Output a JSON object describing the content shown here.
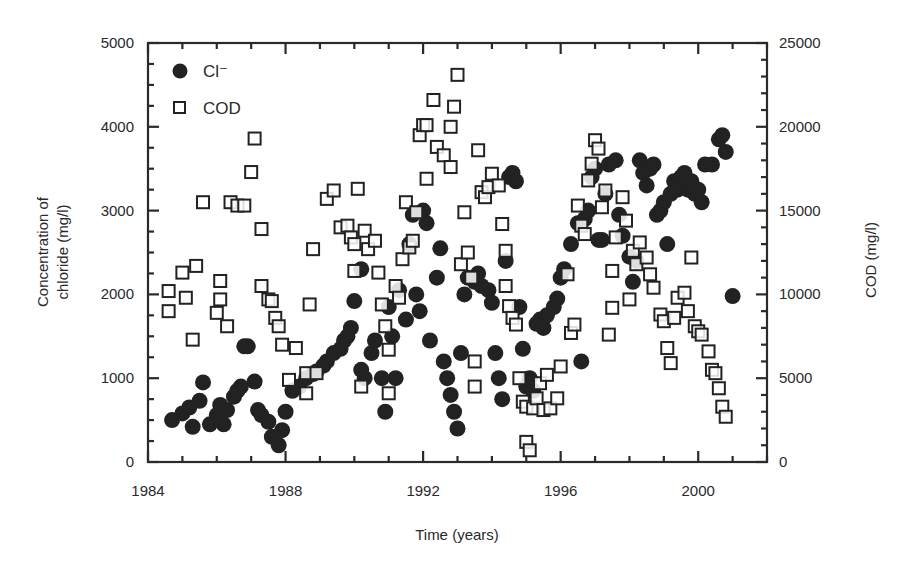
{
  "chart_data": {
    "type": "scatter",
    "title": "",
    "xlabel": "Time (years)",
    "ylabel": "Concentration of chloride (mg/l)",
    "ylabel_lines": [
      "Concentration of",
      "chloride (mg/l)"
    ],
    "y2label": "COD (mg/l)",
    "xlim": [
      1984,
      2002
    ],
    "ylim": [
      0,
      5000
    ],
    "y2lim": [
      0,
      25000
    ],
    "x_ticks": [
      1984,
      1988,
      1992,
      1996,
      2000
    ],
    "x_tick_labels": [
      "1984",
      "1988",
      "1992",
      "1996",
      "2000"
    ],
    "y_ticks": [
      0,
      1000,
      2000,
      3000,
      4000,
      5000
    ],
    "y_tick_labels": [
      "0",
      "1000",
      "2000",
      "3000",
      "4000",
      "5000"
    ],
    "y2_ticks": [
      0,
      5000,
      10000,
      15000,
      20000,
      25000
    ],
    "y2_tick_labels": [
      "0",
      "5000",
      "10000",
      "15000",
      "20000",
      "25000"
    ],
    "grid": false,
    "legend_position": "upper-left-inside",
    "legend": [
      {
        "label": "Cl⁻",
        "marker": "filled-circle",
        "axis": "left"
      },
      {
        "label": "COD",
        "marker": "open-square",
        "axis": "right"
      }
    ],
    "series": [
      {
        "name": "Cl⁻",
        "marker": "filled-circle",
        "axis": "left",
        "points": [
          [
            1984.7,
            500
          ],
          [
            1985.0,
            580
          ],
          [
            1985.2,
            650
          ],
          [
            1985.3,
            420
          ],
          [
            1985.5,
            730
          ],
          [
            1985.6,
            950
          ],
          [
            1985.8,
            450
          ],
          [
            1986.0,
            560
          ],
          [
            1986.1,
            680
          ],
          [
            1986.2,
            450
          ],
          [
            1986.3,
            620
          ],
          [
            1986.5,
            780
          ],
          [
            1986.6,
            850
          ],
          [
            1986.7,
            900
          ],
          [
            1986.8,
            1380
          ],
          [
            1986.9,
            1380
          ],
          [
            1987.1,
            960
          ],
          [
            1987.2,
            620
          ],
          [
            1987.3,
            560
          ],
          [
            1987.5,
            480
          ],
          [
            1987.6,
            300
          ],
          [
            1987.8,
            200
          ],
          [
            1987.9,
            380
          ],
          [
            1988.0,
            600
          ],
          [
            1988.2,
            850
          ],
          [
            1988.4,
            900
          ],
          [
            1988.6,
            1000
          ],
          [
            1988.8,
            1050
          ],
          [
            1988.9,
            1080
          ],
          [
            1989.1,
            1150
          ],
          [
            1989.2,
            1200
          ],
          [
            1989.4,
            1300
          ],
          [
            1989.6,
            1350
          ],
          [
            1989.7,
            1450
          ],
          [
            1989.8,
            1500
          ],
          [
            1989.9,
            1600
          ],
          [
            1990.0,
            1920
          ],
          [
            1990.2,
            2300
          ],
          [
            1990.2,
            1100
          ],
          [
            1990.3,
            1000
          ],
          [
            1990.5,
            1300
          ],
          [
            1990.6,
            1450
          ],
          [
            1990.8,
            1000
          ],
          [
            1990.9,
            600
          ],
          [
            1991.0,
            1850
          ],
          [
            1991.1,
            1500
          ],
          [
            1991.2,
            1000
          ],
          [
            1991.3,
            2050
          ],
          [
            1991.5,
            1700
          ],
          [
            1991.6,
            2600
          ],
          [
            1991.7,
            2950
          ],
          [
            1991.8,
            2000
          ],
          [
            1991.9,
            1800
          ],
          [
            1992.0,
            3000
          ],
          [
            1992.1,
            2850
          ],
          [
            1992.2,
            1450
          ],
          [
            1992.4,
            2200
          ],
          [
            1992.5,
            2550
          ],
          [
            1992.6,
            1200
          ],
          [
            1992.7,
            1000
          ],
          [
            1992.8,
            800
          ],
          [
            1992.9,
            600
          ],
          [
            1993.0,
            400
          ],
          [
            1993.1,
            1300
          ],
          [
            1993.2,
            2000
          ],
          [
            1993.3,
            2200
          ],
          [
            1993.5,
            2150
          ],
          [
            1993.6,
            2250
          ],
          [
            1993.7,
            2100
          ],
          [
            1993.9,
            2050
          ],
          [
            1994.0,
            1900
          ],
          [
            1994.1,
            1300
          ],
          [
            1994.2,
            1000
          ],
          [
            1994.3,
            750
          ],
          [
            1994.4,
            2400
          ],
          [
            1994.5,
            3400
          ],
          [
            1994.6,
            3450
          ],
          [
            1994.7,
            3350
          ],
          [
            1994.8,
            1850
          ],
          [
            1994.9,
            1350
          ],
          [
            1995.0,
            900
          ],
          [
            1995.1,
            1000
          ],
          [
            1995.2,
            850
          ],
          [
            1995.3,
            1650
          ],
          [
            1995.4,
            1700
          ],
          [
            1995.5,
            1600
          ],
          [
            1995.6,
            1750
          ],
          [
            1995.8,
            1850
          ],
          [
            1995.9,
            1950
          ],
          [
            1996.0,
            2200
          ],
          [
            1996.1,
            2300
          ],
          [
            1996.3,
            2600
          ],
          [
            1996.5,
            2850
          ],
          [
            1996.6,
            1200
          ],
          [
            1996.7,
            2900
          ],
          [
            1996.8,
            3000
          ],
          [
            1996.9,
            3400
          ],
          [
            1997.0,
            3500
          ],
          [
            1997.1,
            2650
          ],
          [
            1997.2,
            2650
          ],
          [
            1997.3,
            3200
          ],
          [
            1997.4,
            3550
          ],
          [
            1997.6,
            3600
          ],
          [
            1997.7,
            2950
          ],
          [
            1997.8,
            2700
          ],
          [
            1998.0,
            2450
          ],
          [
            1998.1,
            2150
          ],
          [
            1998.2,
            2400
          ],
          [
            1998.3,
            3600
          ],
          [
            1998.4,
            3450
          ],
          [
            1998.5,
            3300
          ],
          [
            1998.6,
            3500
          ],
          [
            1998.7,
            3550
          ],
          [
            1998.8,
            2950
          ],
          [
            1998.9,
            3000
          ],
          [
            1999.0,
            3100
          ],
          [
            1999.1,
            2600
          ],
          [
            1999.2,
            3200
          ],
          [
            1999.3,
            3350
          ],
          [
            1999.4,
            3250
          ],
          [
            1999.5,
            3400
          ],
          [
            1999.6,
            3450
          ],
          [
            1999.7,
            3250
          ],
          [
            1999.8,
            3350
          ],
          [
            1999.9,
            3200
          ],
          [
            2000.0,
            3250
          ],
          [
            2000.1,
            3100
          ],
          [
            2000.2,
            3550
          ],
          [
            2000.4,
            3550
          ],
          [
            2000.6,
            3850
          ],
          [
            2000.7,
            3900
          ],
          [
            2000.8,
            3700
          ],
          [
            2001.0,
            1980
          ]
        ]
      },
      {
        "name": "COD",
        "marker": "open-square",
        "axis": "right",
        "points": [
          [
            1984.6,
            9000
          ],
          [
            1984.6,
            10200
          ],
          [
            1985.0,
            11300
          ],
          [
            1985.1,
            9800
          ],
          [
            1985.4,
            11700
          ],
          [
            1985.3,
            7300
          ],
          [
            1985.6,
            15500
          ],
          [
            1986.0,
            8900
          ],
          [
            1986.1,
            10800
          ],
          [
            1986.1,
            9700
          ],
          [
            1986.3,
            8100
          ],
          [
            1986.4,
            15500
          ],
          [
            1986.6,
            15300
          ],
          [
            1986.8,
            15300
          ],
          [
            1987.0,
            17300
          ],
          [
            1987.1,
            19300
          ],
          [
            1987.3,
            13900
          ],
          [
            1987.3,
            10500
          ],
          [
            1987.5,
            9700
          ],
          [
            1987.6,
            9600
          ],
          [
            1987.7,
            8600
          ],
          [
            1987.8,
            8100
          ],
          [
            1987.9,
            7000
          ],
          [
            1988.1,
            4900
          ],
          [
            1988.3,
            6800
          ],
          [
            1988.6,
            4100
          ],
          [
            1988.6,
            5300
          ],
          [
            1988.7,
            9400
          ],
          [
            1988.8,
            12700
          ],
          [
            1988.9,
            5300
          ],
          [
            1989.2,
            15700
          ],
          [
            1989.4,
            16200
          ],
          [
            1989.6,
            14000
          ],
          [
            1989.8,
            14100
          ],
          [
            1989.9,
            13400
          ],
          [
            1990.0,
            13000
          ],
          [
            1990.0,
            11400
          ],
          [
            1990.1,
            16300
          ],
          [
            1990.2,
            4500
          ],
          [
            1990.3,
            13800
          ],
          [
            1990.4,
            12700
          ],
          [
            1990.6,
            13200
          ],
          [
            1990.7,
            11300
          ],
          [
            1990.8,
            9400
          ],
          [
            1990.9,
            8100
          ],
          [
            1991.0,
            6700
          ],
          [
            1991.0,
            4100
          ],
          [
            1991.2,
            10500
          ],
          [
            1991.3,
            9800
          ],
          [
            1991.4,
            12100
          ],
          [
            1991.5,
            15500
          ],
          [
            1991.6,
            12800
          ],
          [
            1991.7,
            13200
          ],
          [
            1991.8,
            14900
          ],
          [
            1991.9,
            19500
          ],
          [
            1992.0,
            20100
          ],
          [
            1992.1,
            20100
          ],
          [
            1992.1,
            16900
          ],
          [
            1992.3,
            21600
          ],
          [
            1992.4,
            18800
          ],
          [
            1992.6,
            18300
          ],
          [
            1992.8,
            17600
          ],
          [
            1992.8,
            20000
          ],
          [
            1992.9,
            21200
          ],
          [
            1993.0,
            23100
          ],
          [
            1993.1,
            11800
          ],
          [
            1993.2,
            14900
          ],
          [
            1993.3,
            12500
          ],
          [
            1993.4,
            11000
          ],
          [
            1993.5,
            6000
          ],
          [
            1993.5,
            4500
          ],
          [
            1993.6,
            18600
          ],
          [
            1993.7,
            16100
          ],
          [
            1993.8,
            15800
          ],
          [
            1993.9,
            16400
          ],
          [
            1994.0,
            17200
          ],
          [
            1994.2,
            16500
          ],
          [
            1994.3,
            14200
          ],
          [
            1994.4,
            12600
          ],
          [
            1994.4,
            10500
          ],
          [
            1994.5,
            9300
          ],
          [
            1994.6,
            8600
          ],
          [
            1994.7,
            8200
          ],
          [
            1994.8,
            5000
          ],
          [
            1994.9,
            3600
          ],
          [
            1995.0,
            3300
          ],
          [
            1995.0,
            1200
          ],
          [
            1995.1,
            700
          ],
          [
            1995.2,
            3200
          ],
          [
            1995.3,
            3800
          ],
          [
            1995.4,
            4700
          ],
          [
            1995.5,
            3100
          ],
          [
            1995.6,
            5200
          ],
          [
            1995.7,
            3200
          ],
          [
            1995.9,
            3800
          ],
          [
            1996.0,
            5700
          ],
          [
            1996.2,
            11200
          ],
          [
            1996.3,
            7700
          ],
          [
            1996.4,
            8200
          ],
          [
            1996.5,
            15300
          ],
          [
            1996.6,
            14100
          ],
          [
            1996.7,
            13600
          ],
          [
            1996.8,
            16800
          ],
          [
            1996.9,
            17800
          ],
          [
            1997.0,
            19200
          ],
          [
            1997.1,
            18700
          ],
          [
            1997.2,
            15200
          ],
          [
            1997.3,
            16200
          ],
          [
            1997.4,
            7600
          ],
          [
            1997.5,
            9200
          ],
          [
            1997.5,
            11400
          ],
          [
            1997.6,
            13400
          ],
          [
            1997.8,
            15800
          ],
          [
            1997.9,
            14400
          ],
          [
            1998.0,
            9700
          ],
          [
            1998.1,
            12600
          ],
          [
            1998.2,
            11800
          ],
          [
            1998.3,
            13100
          ],
          [
            1998.5,
            12200
          ],
          [
            1998.6,
            11200
          ],
          [
            1998.7,
            10400
          ],
          [
            1998.9,
            8800
          ],
          [
            1999.0,
            8400
          ],
          [
            1999.1,
            6800
          ],
          [
            1999.2,
            5900
          ],
          [
            1999.3,
            8600
          ],
          [
            1999.4,
            9800
          ],
          [
            1999.6,
            10100
          ],
          [
            1999.7,
            9000
          ],
          [
            1999.8,
            12200
          ],
          [
            1999.9,
            8100
          ],
          [
            2000.0,
            7800
          ],
          [
            2000.1,
            7600
          ],
          [
            2000.3,
            6600
          ],
          [
            2000.4,
            5500
          ],
          [
            2000.5,
            5300
          ],
          [
            2000.6,
            4400
          ],
          [
            2000.7,
            3300
          ],
          [
            2000.8,
            2700
          ]
        ]
      }
    ]
  }
}
